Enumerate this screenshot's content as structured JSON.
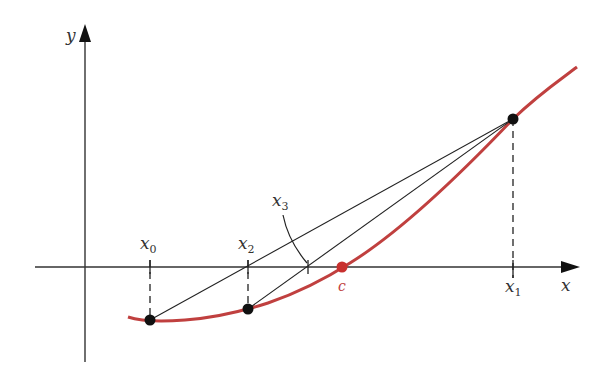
{
  "diagram": {
    "colors": {
      "axis": "#222222",
      "curve": "#c0403f",
      "secant": "#222222",
      "point": "#111111",
      "root": "#c8302e"
    },
    "axes": {
      "x_label": "x",
      "y_label": "y"
    },
    "labels": {
      "x0": {
        "base": "x",
        "sub": "0"
      },
      "x1": {
        "base": "x",
        "sub": "1"
      },
      "x2": {
        "base": "x",
        "sub": "2"
      },
      "x3": {
        "base": "x",
        "sub": "3"
      },
      "c": "c"
    },
    "points": [
      {
        "name": "x0",
        "px": 150,
        "py": 320
      },
      {
        "name": "x2",
        "px": 248,
        "py": 309
      },
      {
        "name": "x1",
        "px": 513,
        "py": 119
      }
    ],
    "axis_intersections": [
      {
        "name": "x2",
        "px": 248
      },
      {
        "name": "x3",
        "px": 308
      },
      {
        "name": "c",
        "px": 342
      }
    ]
  }
}
